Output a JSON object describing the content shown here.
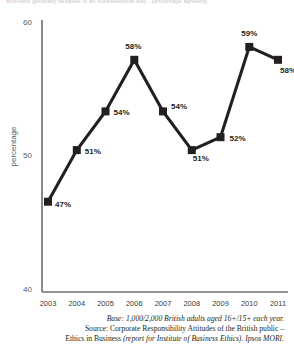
{
  "caption": {
    "top_strip": "Business generally behaves in an honest/ethical way - percentage agreeing"
  },
  "axes": {
    "y_title": "percentage",
    "y_ticks": [
      "60",
      "50",
      "40"
    ],
    "y_min": 40,
    "y_max": 60,
    "x_ticks": [
      "2003",
      "2004",
      "2005",
      "2006",
      "2007",
      "2008",
      "2009",
      "2010",
      "2011"
    ]
  },
  "chart_data": {
    "type": "line",
    "title": "",
    "xlabel": "",
    "ylabel": "percentage",
    "ylim": [
      40,
      60
    ],
    "grid": false,
    "legend": "none",
    "marker": "square",
    "categories": [
      "2003",
      "2004",
      "2005",
      "2006",
      "2007",
      "2008",
      "2009",
      "2010",
      "2011"
    ],
    "values": [
      47,
      51,
      54,
      58,
      54,
      51,
      52,
      59,
      58
    ],
    "point_labels": [
      "47%",
      "51%",
      "54%",
      "58%",
      "54%",
      "51%",
      "52%",
      "59%",
      "58%"
    ],
    "series": [
      {
        "name": "percentage agreeing",
        "values": [
          47,
          51,
          54,
          58,
          54,
          51,
          52,
          59,
          58
        ],
        "color": "#231f20"
      }
    ]
  },
  "colors": {
    "line": "#231f20",
    "marker": "#231f20",
    "axis": "#6d6e71",
    "tick_text": "#58595b",
    "body_text": "#231f20"
  },
  "footnotes": {
    "line1": "Base: 1,000/2,000 British adults aged 16+/15+ each year.",
    "line2": "Source: Corporate Responsibility Attitudes of the British public –",
    "line3_a": "Ethics in Business ",
    "line3_b": "(report for Institute of Business Ethics). Ipsos MORI."
  }
}
